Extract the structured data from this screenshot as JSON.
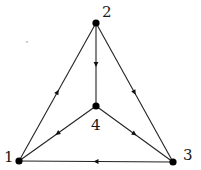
{
  "diagram": {
    "type": "directed-graph",
    "nodes": [
      {
        "id": "1",
        "label": "1",
        "x": 19,
        "y": 161,
        "label_x": 4,
        "label_y": 162
      },
      {
        "id": "2",
        "label": "2",
        "x": 96,
        "y": 23,
        "label_x": 102,
        "label_y": 17
      },
      {
        "id": "3",
        "label": "3",
        "x": 173,
        "y": 162,
        "label_x": 183,
        "label_y": 160
      },
      {
        "id": "4",
        "label": "4",
        "x": 96,
        "y": 106,
        "label_x": 91,
        "label_y": 130
      }
    ],
    "edges": [
      {
        "from": "1",
        "to": "2",
        "label": "1→2"
      },
      {
        "from": "2",
        "to": "4",
        "label": "2→4"
      },
      {
        "from": "2",
        "to": "3",
        "label": "2→3"
      },
      {
        "from": "4",
        "to": "1",
        "label": "4→1"
      },
      {
        "from": "4",
        "to": "3",
        "label": "4→3"
      },
      {
        "from": "3",
        "to": "1",
        "label": "3→1"
      }
    ],
    "colors": {
      "edge": "#222222",
      "node": "#000000",
      "label": "#1a1a1a",
      "background": "#ffffff"
    }
  }
}
